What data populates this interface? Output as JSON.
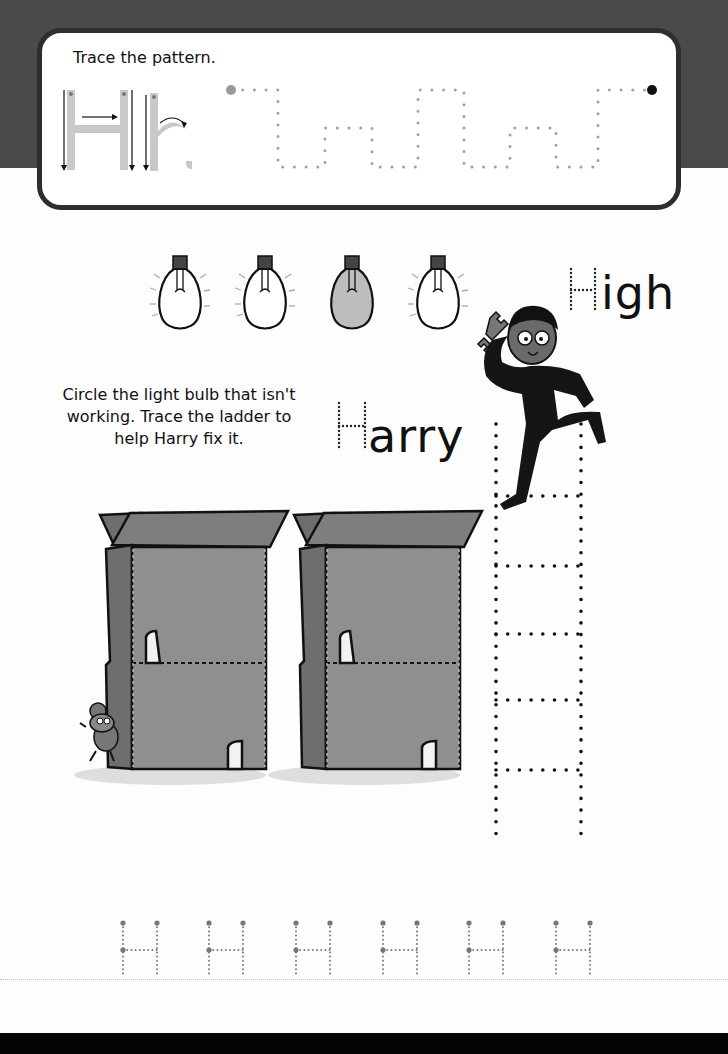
{
  "page": {
    "header_band_color": "#4a4a4a",
    "footer_color": "#050505"
  },
  "trace_card": {
    "title": "Trace the pattern.",
    "example_letters": "Hh",
    "start_dot_color": "#9a9a9a",
    "end_dot_color": "#111111",
    "pattern_path": [
      [
        231,
        90
      ],
      [
        278,
        90
      ],
      [
        278,
        167
      ],
      [
        325,
        167
      ],
      [
        325,
        128
      ],
      [
        372,
        128
      ],
      [
        372,
        167
      ],
      [
        418,
        167
      ],
      [
        418,
        90
      ],
      [
        464,
        90
      ],
      [
        464,
        167
      ],
      [
        510,
        167
      ],
      [
        510,
        128
      ],
      [
        556,
        128
      ],
      [
        556,
        167
      ],
      [
        598,
        167
      ],
      [
        598,
        90
      ],
      [
        652,
        90
      ]
    ]
  },
  "activity": {
    "instruction": "Circle the light bulb that isn't working. Trace the ladder to help Harry fix it.",
    "bulbs": [
      {
        "label": "bulb-1",
        "lit": true
      },
      {
        "label": "bulb-2",
        "lit": true
      },
      {
        "label": "bulb-3",
        "lit": false
      },
      {
        "label": "bulb-4",
        "lit": true
      }
    ],
    "words": {
      "high_traced_letter": "H",
      "high_rest": "igh",
      "harry_traced_letter": "H",
      "harry_rest": "arry"
    },
    "ladder_rungs": 5,
    "character_name": "Harry",
    "box_color": "#8f8f8f",
    "box_side_color": "#6e6e6e"
  },
  "practice_row": {
    "letter": "H",
    "count": 6
  }
}
